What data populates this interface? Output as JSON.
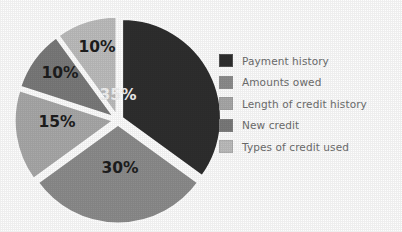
{
  "chart_data": {
    "type": "pie",
    "title": "",
    "categories": [
      "Payment history",
      "Amounts owed",
      "Length of credit history",
      "New credit",
      "Types of credit used"
    ],
    "values": [
      35,
      30,
      15,
      10,
      10
    ],
    "data_labels": [
      "35%",
      "30%",
      "15%",
      "10%",
      "10%"
    ],
    "colors": [
      "#2e2e2e",
      "#8c8c8c",
      "#a8a8a8",
      "#7a7a7a",
      "#bdbdbd"
    ],
    "label_text_colors": [
      "#f2f2f2",
      "#1d1d1d",
      "#1d1d1d",
      "#1d1d1d",
      "#1d1d1d"
    ],
    "legend_position": "right",
    "exploded": true,
    "start_angle_deg": 0,
    "direction": "clockwise",
    "units": "percent",
    "total": 100
  },
  "legend": {
    "items": [
      {
        "label": "Payment history",
        "color": "#2e2e2e",
        "value": "35%"
      },
      {
        "label": "Amounts owed",
        "color": "#8c8c8c",
        "value": "30%"
      },
      {
        "label": "Length of credit history",
        "color": "#a8a8a8",
        "value": "15%"
      },
      {
        "label": "New credit",
        "color": "#7a7a7a",
        "value": "10%"
      },
      {
        "label": "Types of credit used",
        "color": "#bdbdbd",
        "value": "10%"
      }
    ]
  },
  "slices": [
    {
      "name": "payment-history",
      "label": "35%",
      "value": 35,
      "color": "#2e2e2e",
      "text": "light",
      "cx": 104,
      "cy": 87
    },
    {
      "name": "amounts-owed",
      "label": "30%",
      "value": 30,
      "color": "#8c8c8c",
      "text": "dark",
      "cx": 106,
      "cy": 160
    },
    {
      "name": "length-of-credit-history",
      "label": "15%",
      "value": 15,
      "color": "#a8a8a8",
      "text": "dark",
      "cx": 43,
      "cy": 114
    },
    {
      "name": "new-credit",
      "label": "10%",
      "value": 10,
      "color": "#7a7a7a",
      "text": "dark",
      "cx": 46,
      "cy": 65
    },
    {
      "name": "types-of-credit-used",
      "label": "10%",
      "value": 10,
      "color": "#bdbdbd",
      "text": "dark",
      "cx": 83,
      "cy": 39
    }
  ]
}
